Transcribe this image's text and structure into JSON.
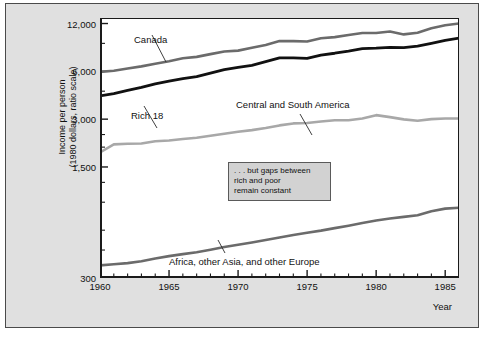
{
  "chart_data": {
    "type": "line",
    "title": "",
    "xlabel": "Year",
    "ylabel_line1": "Income per person",
    "ylabel_line2": "(1980 dollars, ratio scale)",
    "yscale": "log",
    "ylim": [
      300,
      13000
    ],
    "xlim": [
      1960,
      1986
    ],
    "grid": false,
    "legend_position": "inline-annotations",
    "ytick_labels": [
      "12,000",
      "6,000",
      "3,000",
      "1,500",
      "300"
    ],
    "ytick_values": [
      12000,
      6000,
      3000,
      1500,
      300
    ],
    "yminor_values": [
      9000,
      4500,
      2400,
      2000,
      1200,
      900,
      600,
      450
    ],
    "xtick_labels": [
      "1960",
      "1965",
      "1970",
      "1975",
      "1980",
      "1985"
    ],
    "xtick_values": [
      1960,
      1965,
      1970,
      1975,
      1980,
      1985
    ],
    "annotation": {
      "line1": ". . . but gaps between",
      "line2": "rich and poor",
      "line3": "remain constant"
    },
    "series": [
      {
        "name": "Canada",
        "color": "#6b6b6b",
        "width": 2.6,
        "x": [
          1960,
          1961,
          1962,
          1963,
          1964,
          1965,
          1966,
          1967,
          1968,
          1969,
          1970,
          1971,
          1972,
          1973,
          1974,
          1975,
          1976,
          1977,
          1978,
          1979,
          1980,
          1981,
          1982,
          1983,
          1984,
          1985,
          1986
        ],
        "values": [
          5950,
          6050,
          6250,
          6450,
          6700,
          6950,
          7250,
          7400,
          7700,
          8000,
          8100,
          8450,
          8800,
          9300,
          9300,
          9250,
          9700,
          9850,
          10150,
          10450,
          10450,
          10700,
          10250,
          10500,
          11200,
          11700,
          12000
        ]
      },
      {
        "name": "Rich 18",
        "color": "#111111",
        "width": 2.8,
        "x": [
          1960,
          1961,
          1962,
          1963,
          1964,
          1965,
          1966,
          1967,
          1968,
          1969,
          1970,
          1971,
          1972,
          1973,
          1974,
          1975,
          1976,
          1977,
          1978,
          1979,
          1980,
          1981,
          1982,
          1983,
          1984,
          1985,
          1986
        ],
        "values": [
          4200,
          4350,
          4550,
          4750,
          5000,
          5200,
          5400,
          5550,
          5850,
          6150,
          6350,
          6550,
          6900,
          7300,
          7300,
          7250,
          7600,
          7800,
          8050,
          8350,
          8400,
          8500,
          8450,
          8650,
          9000,
          9400,
          9700
        ]
      },
      {
        "name": "Central and South America",
        "color": "#a8a8a8",
        "width": 2.6,
        "x": [
          1960,
          1961,
          1962,
          1963,
          1964,
          1965,
          1966,
          1967,
          1968,
          1969,
          1970,
          1971,
          1972,
          1973,
          1974,
          1975,
          1976,
          1977,
          1978,
          1979,
          1980,
          1981,
          1982,
          1983,
          1984,
          1985,
          1986
        ],
        "values": [
          1850,
          2080,
          2100,
          2110,
          2180,
          2200,
          2250,
          2290,
          2360,
          2430,
          2500,
          2560,
          2640,
          2740,
          2820,
          2840,
          2900,
          2950,
          2950,
          3030,
          3180,
          3090,
          2990,
          2930,
          3000,
          3030,
          3030
        ]
      },
      {
        "name": "Africa, other Asia, and other Europe",
        "color": "#6b6b6b",
        "width": 2.6,
        "x": [
          1960,
          1961,
          1962,
          1963,
          1964,
          1965,
          1966,
          1967,
          1968,
          1969,
          1970,
          1971,
          1972,
          1973,
          1974,
          1975,
          1976,
          1977,
          1978,
          1979,
          1980,
          1981,
          1982,
          1983,
          1984,
          1985,
          1986
        ],
        "values": [
          360,
          366,
          372,
          382,
          398,
          412,
          424,
          436,
          452,
          470,
          486,
          502,
          520,
          540,
          560,
          578,
          596,
          618,
          640,
          665,
          690,
          710,
          728,
          745,
          790,
          820,
          830
        ]
      }
    ],
    "series_labels": [
      {
        "name": "Canada",
        "text": "Canada",
        "x": 133,
        "y": 36
      },
      {
        "name": "Rich 18",
        "text": "Rich 18",
        "x": 130,
        "y": 112
      },
      {
        "name": "Central and South America",
        "text": "Central and South America",
        "x": 235,
        "y": 101
      },
      {
        "name": "Africa, other Asia, and other Europe",
        "text": "Africa, other Asia, and other Europe",
        "x": 168,
        "y": 258
      }
    ]
  }
}
